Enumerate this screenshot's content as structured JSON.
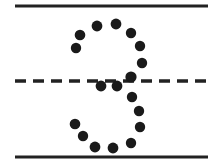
{
  "figure": {
    "canvas": {
      "width": 223,
      "height": 165,
      "background_color": "#ffffff"
    },
    "ink_color": "#1a1a1a",
    "line_color": "#222222",
    "lines": [
      {
        "name": "top-solid-rule",
        "style": "solid",
        "x1": 15,
        "y1": 6,
        "x2": 208,
        "y2": 6,
        "stroke_width": 3.2
      },
      {
        "name": "middle-dashed-rule",
        "style": "dashed",
        "x1": 15,
        "y1": 81,
        "x2": 211,
        "y2": 81,
        "stroke_width": 3.4,
        "dash_pattern": "11 7"
      },
      {
        "name": "bottom-solid-rule",
        "style": "solid",
        "x1": 15,
        "y1": 157,
        "x2": 208,
        "y2": 157,
        "stroke_width": 3.2
      }
    ],
    "dot_radius": 5.2,
    "dot_count": 18,
    "dots": [
      {
        "name": "dot-upper-left-outer",
        "x": 76,
        "y": 48,
        "r": 5.2
      },
      {
        "name": "dot-upper-left-upper",
        "x": 80,
        "y": 35,
        "r": 5.3
      },
      {
        "name": "dot-upper-crest-left",
        "x": 97,
        "y": 26,
        "r": 5.4
      },
      {
        "name": "dot-upper-crest-right",
        "x": 116,
        "y": 24,
        "r": 5.4
      },
      {
        "name": "dot-upper-right-upper",
        "x": 131,
        "y": 33,
        "r": 5.2
      },
      {
        "name": "dot-upper-right-mid",
        "x": 140,
        "y": 46,
        "r": 5.2
      },
      {
        "name": "dot-upper-right-lower",
        "x": 142,
        "y": 63,
        "r": 5.2
      },
      {
        "name": "dot-waist-right",
        "x": 131,
        "y": 77,
        "r": 5.6
      },
      {
        "name": "dot-waist-center",
        "x": 117,
        "y": 86,
        "r": 5.4
      },
      {
        "name": "dot-waist-left",
        "x": 101,
        "y": 86,
        "r": 5.4
      },
      {
        "name": "dot-lower-right-upper",
        "x": 132,
        "y": 97,
        "r": 5.2
      },
      {
        "name": "dot-lower-right-mid",
        "x": 139,
        "y": 111,
        "r": 5.2
      },
      {
        "name": "dot-lower-right-low",
        "x": 140,
        "y": 127,
        "r": 5.2
      },
      {
        "name": "dot-lower-right-tail",
        "x": 131,
        "y": 143,
        "r": 5.2
      },
      {
        "name": "dot-bottom-right",
        "x": 113,
        "y": 148,
        "r": 5.4
      },
      {
        "name": "dot-bottom-left",
        "x": 95,
        "y": 147,
        "r": 5.4
      },
      {
        "name": "dot-lower-left-lower",
        "x": 83,
        "y": 136,
        "r": 5.2
      },
      {
        "name": "dot-lower-left-upper",
        "x": 75,
        "y": 124,
        "r": 5.3
      }
    ]
  }
}
